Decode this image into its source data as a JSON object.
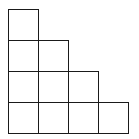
{
  "diagram": {
    "type": "staircase-grid",
    "rows": [
      1,
      2,
      3,
      4
    ],
    "total_squares": 10,
    "origin": {
      "x": 8,
      "y": 9
    },
    "cell_width": 30,
    "cell_height": 31,
    "line_color": "#1a1a1a",
    "background": "#ffffff"
  }
}
